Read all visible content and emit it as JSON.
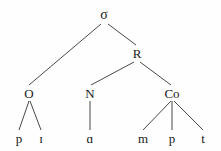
{
  "diagram": {
    "kind": "syllable-tree",
    "transcription": "pɪɑmpt",
    "colors": {
      "background": "#fefefe",
      "ink": "#1a1a1a",
      "branch": "#333333"
    },
    "nodes": [
      {
        "id": "sigma",
        "label": "σ",
        "tier": "root",
        "x": 104,
        "y": 15
      },
      {
        "id": "onset",
        "label": "O",
        "tier": "const",
        "x": 29,
        "y": 93
      },
      {
        "id": "rhyme",
        "label": "R",
        "tier": "mid",
        "x": 137,
        "y": 53
      },
      {
        "id": "nucleus",
        "label": "N",
        "tier": "const",
        "x": 90,
        "y": 93
      },
      {
        "id": "coda",
        "label": "Co",
        "tier": "const",
        "x": 172,
        "y": 93
      },
      {
        "id": "seg-p1",
        "label": "p",
        "tier": "leaf",
        "x": 19,
        "y": 138
      },
      {
        "id": "seg-i",
        "label": "ɪ",
        "tier": "leaf",
        "x": 41,
        "y": 138
      },
      {
        "id": "seg-a",
        "label": "ɑ",
        "tier": "leaf",
        "x": 90,
        "y": 138
      },
      {
        "id": "seg-m",
        "label": "m",
        "tier": "leaf",
        "x": 143,
        "y": 138
      },
      {
        "id": "seg-p2",
        "label": "p",
        "tier": "leaf",
        "x": 172,
        "y": 138
      },
      {
        "id": "seg-t",
        "label": "t",
        "tier": "leaf",
        "x": 203,
        "y": 138
      }
    ],
    "edges": [
      {
        "id": "edge-sigma-onset",
        "from": "sigma",
        "to": "onset",
        "x1": 101,
        "y1": 24,
        "x2": 29,
        "y2": 85
      },
      {
        "id": "edge-sigma-rhyme",
        "from": "sigma",
        "to": "rhyme",
        "x1": 108,
        "y1": 24,
        "x2": 136,
        "y2": 45
      },
      {
        "id": "edge-rhyme-nucleus",
        "from": "rhyme",
        "to": "nucleus",
        "x1": 134,
        "y1": 62,
        "x2": 91,
        "y2": 85
      },
      {
        "id": "edge-rhyme-coda",
        "from": "rhyme",
        "to": "coda",
        "x1": 140,
        "y1": 62,
        "x2": 171,
        "y2": 85
      },
      {
        "id": "edge-onset-p1",
        "from": "onset",
        "to": "seg-p1",
        "x1": 29,
        "y1": 101,
        "x2": 19,
        "y2": 130
      },
      {
        "id": "edge-onset-i",
        "from": "onset",
        "to": "seg-i",
        "x1": 30,
        "y1": 101,
        "x2": 41,
        "y2": 130
      },
      {
        "id": "edge-nucleus-a",
        "from": "nucleus",
        "to": "seg-a",
        "x1": 90,
        "y1": 101,
        "x2": 90,
        "y2": 130
      },
      {
        "id": "edge-coda-m",
        "from": "coda",
        "to": "seg-m",
        "x1": 171,
        "y1": 101,
        "x2": 143,
        "y2": 130
      },
      {
        "id": "edge-coda-p2",
        "from": "coda",
        "to": "seg-p2",
        "x1": 172,
        "y1": 101,
        "x2": 172,
        "y2": 130
      },
      {
        "id": "edge-coda-t",
        "from": "coda",
        "to": "seg-t",
        "x1": 174,
        "y1": 101,
        "x2": 203,
        "y2": 130
      }
    ]
  }
}
